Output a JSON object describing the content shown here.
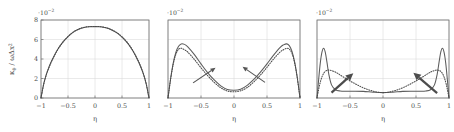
{
  "figure": {
    "axis_label_x": "η",
    "axis_label_y_parts": {
      "kappa": "κ",
      "kappa_sub": "θ",
      "slash": " / ",
      "omega": "ω",
      "delta": "Δ",
      "x": "x",
      "x_sup": "2"
    },
    "exponent_label": "·10",
    "exponent_sup": "−2",
    "x_ticks": [
      "−1",
      "−0.5",
      "0",
      "0.5",
      "1"
    ],
    "x_tick_values": [
      -1,
      -0.5,
      0,
      0.5,
      1
    ],
    "y_ticks": [
      "0",
      "2",
      "4",
      "6",
      "8"
    ],
    "y_tick_values": [
      0,
      2,
      4,
      6,
      8
    ],
    "colors": {
      "curve_solid": "#5c5c5c",
      "curve_dotted": "#4a4a4a",
      "grid": "#d9d9d9",
      "axis": "#6e6e6e",
      "arrow": "#4c4c4c",
      "background": "#ffffff"
    }
  },
  "chart_data": {
    "type": "line",
    "title": "",
    "xlabel": "η",
    "ylabel": "κ_θ / ωΔx²",
    "xlim": [
      -1,
      1
    ],
    "ylim": [
      0,
      8
    ],
    "y_scale": "1e-2",
    "grid": true,
    "legend": "none",
    "panels": [
      {
        "index": 1,
        "name": "panel-left",
        "show_y_ticks": true,
        "arrows": [],
        "series": [
          {
            "name": "solid",
            "style": "solid",
            "x": [
              -1.0,
              -0.95,
              -0.9,
              -0.85,
              -0.8,
              -0.7,
              -0.6,
              -0.5,
              -0.4,
              -0.3,
              -0.2,
              -0.1,
              0.0,
              0.1,
              0.2,
              0.3,
              0.4,
              0.5,
              0.6,
              0.7,
              0.8,
              0.85,
              0.9,
              0.95,
              1.0
            ],
            "y": [
              0.0,
              1.45,
              2.45,
              3.2,
              3.85,
              4.9,
              5.7,
              6.3,
              6.75,
              7.05,
              7.22,
              7.3,
              7.32,
              7.3,
              7.2,
              7.0,
              6.7,
              6.25,
              5.65,
              4.85,
              3.8,
              3.15,
              2.4,
              1.4,
              0.0
            ]
          },
          {
            "name": "dotted",
            "style": "dotted",
            "x": [
              -1.0,
              -0.95,
              -0.9,
              -0.85,
              -0.8,
              -0.7,
              -0.6,
              -0.5,
              -0.4,
              -0.3,
              -0.2,
              -0.1,
              0.0,
              0.1,
              0.2,
              0.3,
              0.4,
              0.5,
              0.6,
              0.7,
              0.8,
              0.85,
              0.9,
              0.95,
              1.0
            ],
            "y": [
              0.0,
              1.4,
              2.4,
              3.15,
              3.8,
              4.88,
              5.68,
              6.3,
              6.78,
              7.08,
              7.25,
              7.33,
              7.34,
              7.31,
              7.22,
              7.02,
              6.72,
              6.28,
              5.68,
              4.88,
              3.82,
              3.18,
              2.42,
              1.42,
              0.0
            ]
          }
        ]
      },
      {
        "index": 2,
        "name": "panel-middle",
        "show_y_ticks": false,
        "arrows": [
          {
            "name": "arrow-left",
            "x1": -0.62,
            "y1": 1.55,
            "x2": -0.28,
            "y2": 3.1,
            "weight": "thin"
          },
          {
            "name": "arrow-right",
            "x1": 0.47,
            "y1": 1.6,
            "x2": 0.13,
            "y2": 3.2,
            "weight": "thin"
          }
        ],
        "series": [
          {
            "name": "solid",
            "style": "solid",
            "x": [
              -1.0,
              -0.96,
              -0.92,
              -0.88,
              -0.84,
              -0.8,
              -0.75,
              -0.7,
              -0.6,
              -0.5,
              -0.4,
              -0.3,
              -0.2,
              -0.1,
              0.0,
              0.1,
              0.2,
              0.3,
              0.4,
              0.5,
              0.6,
              0.7,
              0.75,
              0.8,
              0.84,
              0.88,
              0.92,
              0.96,
              1.0
            ],
            "y": [
              0.0,
              2.0,
              3.6,
              4.7,
              5.3,
              5.55,
              5.5,
              5.25,
              4.45,
              3.5,
              2.6,
              1.85,
              1.25,
              0.88,
              0.8,
              0.9,
              1.3,
              1.9,
              2.65,
              3.5,
              4.4,
              5.2,
              5.45,
              5.55,
              5.35,
              4.75,
              3.65,
              2.05,
              0.0
            ]
          },
          {
            "name": "dotted",
            "style": "dotted",
            "x": [
              -1.0,
              -0.96,
              -0.92,
              -0.88,
              -0.84,
              -0.8,
              -0.75,
              -0.7,
              -0.6,
              -0.5,
              -0.4,
              -0.3,
              -0.2,
              -0.1,
              0.0,
              0.1,
              0.2,
              0.3,
              0.4,
              0.5,
              0.6,
              0.7,
              0.75,
              0.8,
              0.84,
              0.88,
              0.92,
              0.96,
              1.0
            ],
            "y": [
              0.0,
              1.95,
              3.5,
              4.5,
              5.0,
              5.1,
              4.95,
              4.7,
              3.95,
              3.1,
              2.3,
              1.6,
              1.05,
              0.72,
              0.64,
              0.74,
              1.08,
              1.65,
              2.35,
              3.15,
              4.0,
              4.72,
              4.95,
              5.1,
              5.0,
              4.55,
              3.55,
              2.0,
              0.0
            ]
          }
        ]
      },
      {
        "index": 3,
        "name": "panel-right",
        "show_y_ticks": false,
        "arrows": [
          {
            "name": "arrow-left",
            "x1": -0.78,
            "y1": 0.55,
            "x2": -0.45,
            "y2": 2.55,
            "weight": "thick"
          },
          {
            "name": "arrow-right",
            "x1": 0.82,
            "y1": 0.5,
            "x2": 0.46,
            "y2": 2.6,
            "weight": "thick"
          }
        ],
        "series": [
          {
            "name": "solid",
            "style": "solid",
            "x": [
              -1.0,
              -0.975,
              -0.95,
              -0.925,
              -0.9,
              -0.875,
              -0.85,
              -0.82,
              -0.78,
              -0.72,
              -0.65,
              -0.55,
              -0.45,
              -0.3,
              -0.15,
              0.0,
              0.15,
              0.3,
              0.45,
              0.55,
              0.65,
              0.72,
              0.78,
              0.82,
              0.85,
              0.875,
              0.9,
              0.925,
              0.95,
              0.975,
              1.0
            ],
            "y": [
              0.0,
              1.9,
              3.6,
              4.7,
              5.1,
              4.7,
              3.7,
              2.4,
              1.35,
              0.85,
              0.72,
              0.7,
              0.7,
              0.68,
              0.6,
              0.55,
              0.6,
              0.68,
              0.7,
              0.7,
              0.72,
              0.85,
              1.35,
              2.4,
              3.7,
              4.7,
              5.1,
              4.7,
              3.6,
              1.9,
              0.0
            ]
          },
          {
            "name": "dotted",
            "style": "dotted",
            "x": [
              -1.0,
              -0.96,
              -0.92,
              -0.88,
              -0.84,
              -0.8,
              -0.74,
              -0.68,
              -0.6,
              -0.5,
              -0.4,
              -0.3,
              -0.2,
              -0.1,
              0.0,
              0.1,
              0.2,
              0.3,
              0.4,
              0.5,
              0.6,
              0.68,
              0.74,
              0.8,
              0.84,
              0.88,
              0.92,
              0.96,
              1.0
            ],
            "y": [
              0.0,
              1.35,
              2.25,
              2.7,
              2.85,
              2.85,
              2.72,
              2.5,
              2.15,
              1.75,
              1.38,
              1.05,
              0.8,
              0.62,
              0.55,
              0.62,
              0.8,
              1.05,
              1.38,
              1.75,
              2.15,
              2.5,
              2.72,
              2.85,
              2.85,
              2.7,
              2.25,
              1.35,
              0.0
            ]
          }
        ]
      }
    ]
  }
}
